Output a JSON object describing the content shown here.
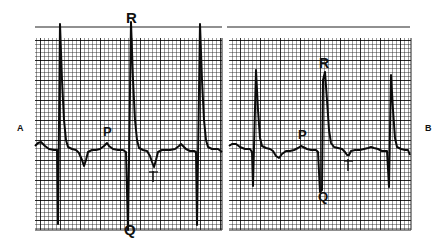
{
  "figure": {
    "panels": [
      {
        "id": "A",
        "label": "A",
        "wave_labels": {
          "R": "R",
          "Q": "Q",
          "P": "P",
          "T": "T"
        }
      },
      {
        "id": "B",
        "label": "B",
        "wave_labels": {
          "R": "R",
          "Q": "Q",
          "P": "P",
          "T": "T"
        }
      }
    ],
    "colors": {
      "grid": "#1a1a1a",
      "trace": "#111111",
      "background": "#ffffff"
    }
  }
}
